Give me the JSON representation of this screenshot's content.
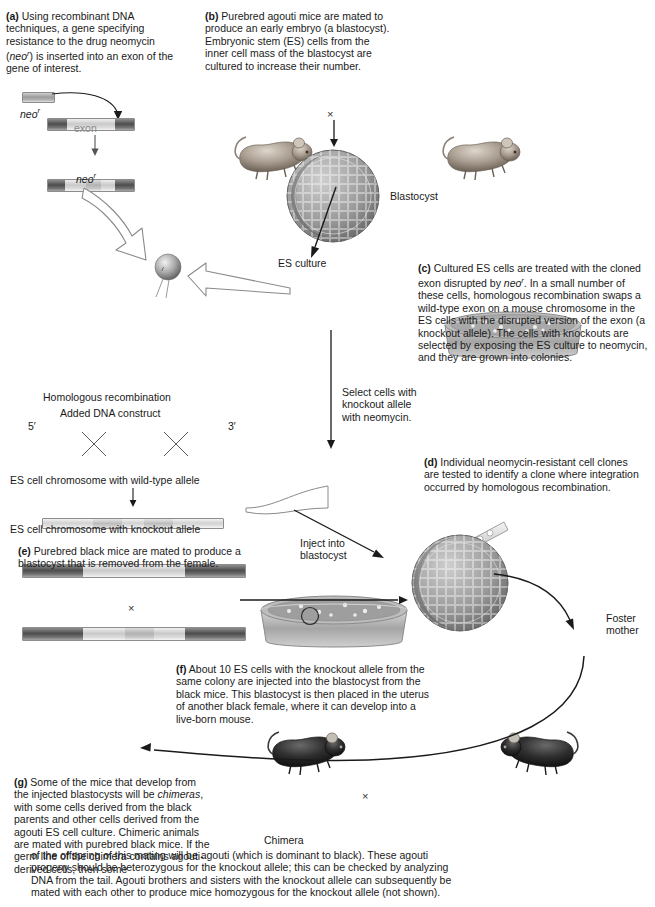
{
  "figure": {
    "panels": {
      "a": {
        "tag": "(a)",
        "text": "Using recombinant DNA techniques, a gene specifying resistance to the drug neomycin (neo r) is inserted into an exon of the gene of interest.",
        "labels": {
          "neo_top": "neo",
          "neo_sup": "r",
          "exon": "exon",
          "neo_bottom": "neo",
          "neo_bottom_sup": "r"
        }
      },
      "b": {
        "tag": "(b)",
        "text": "Purebred agouti mice are mated to produce an early embryo (a blastocyst). Embryonic stem (ES) cells from the inner cell mass of the blastocyst are cultured to increase their number.",
        "labels": {
          "cross": "×",
          "blastocyst": "Blastocyst",
          "es_culture": "ES culture"
        }
      },
      "c": {
        "tag": "(c)",
        "text": "Cultured ES cells are treated with the cloned exon disrupted by neo r. In a small number of these cells, homologous recombination swaps a wild-type exon on a mouse chromosome in the ES cells with the disrupted version of the exon (a knockout allele). The cells with knockouts are selected by exposing the ES culture to neomycin, and they are grown into colonies."
      },
      "d": {
        "tag": "(d)",
        "text": "Individual neomycin-resistant cell clones are tested to identify a clone where integration occurred by homologous recombination."
      },
      "e": {
        "tag": "(e)",
        "text": "Purebred black mice are mated to produce a blastocyst that is removed from the female.",
        "labels": {
          "cross": "×"
        }
      },
      "f": {
        "tag": "(f)",
        "text": "About 10 ES cells with the knockout allele from the same colony are injected into the blastocyst from the black mice. This blastocyst is then placed in the uterus of another black female, where it can develop into a live-born mouse."
      },
      "g": {
        "tag": "(g)",
        "text": "Some of the mice that develop from the injected blastocysts will be chimeras, with some cells derived from the black parents and other cells derived from the agouti ES cell culture. Chimeric animals are mated with purebred black mice. If the germ line of the chimera contains agouti-derived cells, then some of the offspring of this mating will be agouti (which is dominant to black). These agouti progeny should be heterozygous for the knockout allele; this can be checked by analyzing DNA from the tail. Agouti brothers and sisters with the knockout allele can subsequently be mated with each other to produce mice homozygous for the knockout allele (not shown).",
        "labels": {
          "chimera": "Chimera",
          "cross": "×"
        }
      }
    },
    "recombination": {
      "title": "Homologous recombination",
      "subtitle": "Added DNA construct",
      "five_prime": "5′",
      "three_prime": "3′",
      "wild_type_label": "ES cell chromosome with wild-type allele",
      "knockout_label": "ES cell chromosome with knockout allele"
    },
    "flow_labels": {
      "select_cells": "Select cells with knockout allele with neomycin.",
      "inject": "Inject into blastocyst",
      "foster_mother": "Foster mother"
    },
    "colors": {
      "dark_segment": "#4d4d4d",
      "light_segment": "#c9c9c9",
      "text": "#1a1a1a",
      "exon_label": "#8a8a8a",
      "background": "#ffffff"
    }
  }
}
